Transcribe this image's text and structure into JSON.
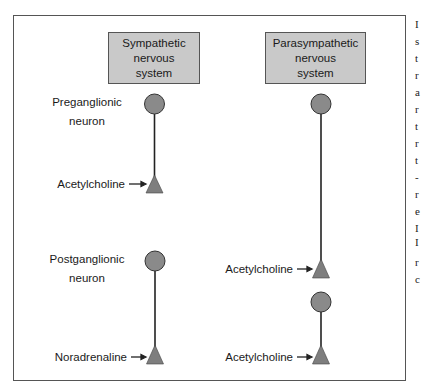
{
  "diagram": {
    "columns": [
      {
        "title_lines": [
          "Sympathetic",
          "nervous",
          "system"
        ],
        "preganglionic_label_lines": [
          "Preganglionic",
          "neuron"
        ],
        "preganglionic_transmitter": "Acetylcholine",
        "postganglionic_label_lines": [
          "Postganglionic",
          "neuron"
        ],
        "postganglionic_transmitter": "Noradrenaline"
      },
      {
        "title_lines": [
          "Parasympathetic",
          "nervous",
          "system"
        ],
        "preganglionic_transmitter": "Acetylcholine",
        "postganglionic_transmitter": "Acetylcholine"
      }
    ],
    "colors": {
      "box_fill": "#c9c9c9",
      "neuron_fill": "#8a8a8a",
      "line": "#222222"
    }
  },
  "edge_text": [
    "I",
    "s",
    "t",
    "r",
    "a",
    "r",
    "t",
    "r",
    "t",
    "-",
    "r",
    "e",
    "I",
    "I",
    "r",
    "c"
  ]
}
